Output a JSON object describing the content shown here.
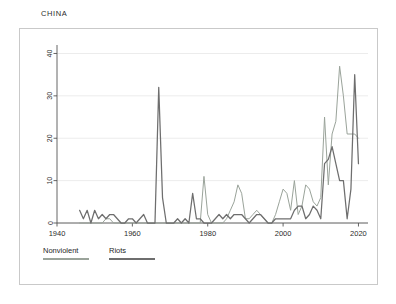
{
  "chart_title": "CHINA",
  "colors": {
    "nonviolent": "#9aa39a",
    "riots": "#6e6e6e",
    "frame": "#c9c9c9",
    "grid": "#ececec",
    "axis": "#555555",
    "text": "#2b2b2b"
  },
  "legend": {
    "items": [
      {
        "label": "Nonviolent",
        "color_key": "nonviolent"
      },
      {
        "label": "Riots",
        "color_key": "riots"
      }
    ]
  },
  "chart_data": {
    "type": "line",
    "title": "CHINA",
    "xlabel": "",
    "ylabel": "",
    "xlim": [
      1940,
      2022
    ],
    "ylim": [
      0,
      42
    ],
    "xticks": [
      1940,
      1960,
      1980,
      2000,
      2020
    ],
    "xtick_labels": [
      "1940",
      "1960",
      "1980",
      "2000",
      "2020"
    ],
    "yticks": [
      0,
      10,
      20,
      30,
      40
    ],
    "ytick_labels": [
      "0",
      "10",
      "20",
      "30",
      "40"
    ],
    "grid": "horizontal",
    "legend_position": "below-axis-left",
    "series": [
      {
        "name": "Nonviolent",
        "color": "#9aa39a",
        "x": [
          1946,
          1947,
          1948,
          1949,
          1950,
          1951,
          1952,
          1953,
          1954,
          1955,
          1956,
          1957,
          1958,
          1959,
          1960,
          1961,
          1962,
          1963,
          1964,
          1965,
          1966,
          1967,
          1968,
          1969,
          1970,
          1971,
          1972,
          1973,
          1974,
          1975,
          1976,
          1977,
          1978,
          1979,
          1980,
          1981,
          1982,
          1983,
          1984,
          1985,
          1986,
          1987,
          1988,
          1989,
          1990,
          1991,
          1992,
          1993,
          1994,
          1995,
          1996,
          1997,
          1998,
          1999,
          2000,
          2001,
          2002,
          2003,
          2004,
          2005,
          2006,
          2007,
          2008,
          2009,
          2010,
          2011,
          2012,
          2013,
          2014,
          2015,
          2016,
          2017,
          2018,
          2019,
          2020
        ],
        "values": [
          0,
          0,
          0,
          0,
          0,
          0,
          0,
          1,
          1,
          0,
          0,
          0,
          0,
          0,
          0,
          0,
          0,
          0,
          0,
          0,
          0,
          0,
          0,
          0,
          0,
          0,
          0,
          0,
          0,
          0,
          0,
          0,
          0,
          11,
          2,
          0,
          0,
          0,
          0,
          1,
          3,
          5,
          9,
          7,
          1,
          1,
          2,
          3,
          2,
          1,
          0,
          0,
          2,
          5,
          8,
          7,
          3,
          10,
          2,
          4,
          9,
          8,
          5,
          4,
          6,
          25,
          9,
          21,
          24,
          37,
          30,
          21,
          21,
          21,
          20
        ]
      },
      {
        "name": "Riots",
        "color": "#6e6e6e",
        "x": [
          1946,
          1947,
          1948,
          1949,
          1950,
          1951,
          1952,
          1953,
          1954,
          1955,
          1956,
          1957,
          1958,
          1959,
          1960,
          1961,
          1962,
          1963,
          1964,
          1965,
          1966,
          1967,
          1968,
          1969,
          1970,
          1971,
          1972,
          1973,
          1974,
          1975,
          1976,
          1977,
          1978,
          1979,
          1980,
          1981,
          1982,
          1983,
          1984,
          1985,
          1986,
          1987,
          1988,
          1989,
          1990,
          1991,
          1992,
          1993,
          1994,
          1995,
          1996,
          1997,
          1998,
          1999,
          2000,
          2001,
          2002,
          2003,
          2004,
          2005,
          2006,
          2007,
          2008,
          2009,
          2010,
          2011,
          2012,
          2013,
          2014,
          2015,
          2016,
          2017,
          2018,
          2019,
          2020
        ],
        "values": [
          3,
          1,
          3,
          0,
          3,
          1,
          2,
          1,
          2,
          2,
          1,
          0,
          0,
          1,
          1,
          0,
          1,
          2,
          0,
          0,
          0,
          32,
          6,
          0,
          0,
          0,
          1,
          0,
          1,
          0,
          7,
          1,
          1,
          0,
          0,
          0,
          1,
          2,
          1,
          2,
          1,
          2,
          2,
          2,
          1,
          0,
          1,
          2,
          2,
          1,
          0,
          0,
          1,
          1,
          1,
          1,
          1,
          3,
          4,
          4,
          1,
          2,
          4,
          3,
          1,
          14,
          15,
          18,
          14,
          10,
          10,
          1,
          8,
          35,
          14
        ]
      }
    ]
  }
}
